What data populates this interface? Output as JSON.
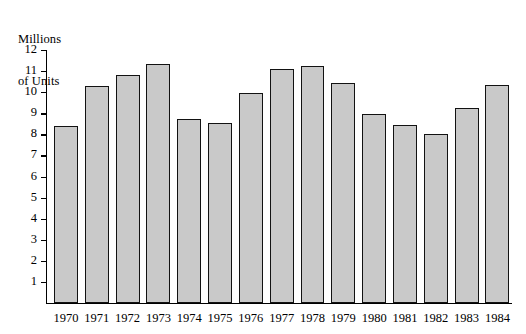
{
  "chart_data": {
    "type": "bar",
    "title": "",
    "ylabel": "Millions\nof Units",
    "ylabel_lines": [
      "Millions",
      "of Units"
    ],
    "xlabel": "",
    "categories": [
      "1970",
      "1971",
      "1972",
      "1973",
      "1974",
      "1975",
      "1976",
      "1977",
      "1978",
      "1979",
      "1980",
      "1981",
      "1982",
      "1983",
      "1984"
    ],
    "values": [
      8.4,
      10.3,
      10.8,
      11.35,
      8.75,
      8.55,
      9.95,
      11.1,
      11.25,
      10.45,
      8.95,
      8.45,
      8.0,
      9.25,
      10.35
    ],
    "ylim": [
      0,
      12
    ],
    "y_ticks": [
      12,
      11,
      10,
      9,
      8,
      7,
      6,
      5,
      4,
      3,
      2,
      1
    ],
    "y_tick_labels": [
      "12",
      "11",
      "10",
      "9",
      "8",
      "7",
      "6",
      "5",
      "4",
      "3",
      "2",
      "1"
    ],
    "grid": false,
    "legend": null,
    "bar_fill_color": "#c9c9c9",
    "bar_edge_color": "#121212",
    "axis_color": "#000000",
    "background_color": "#ffffff"
  }
}
